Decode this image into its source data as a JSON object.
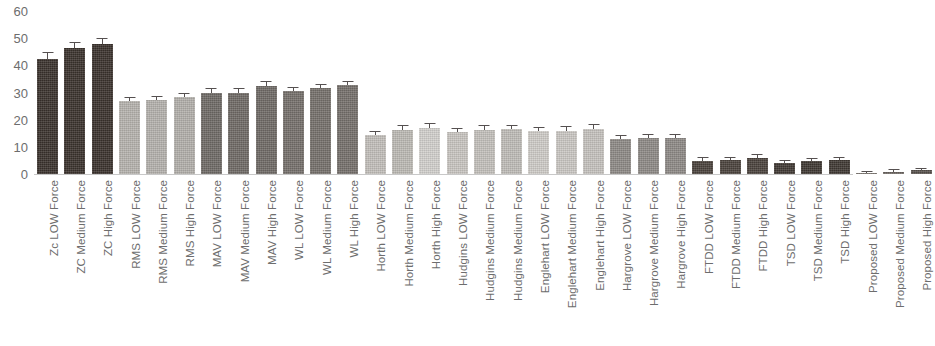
{
  "chart_data": {
    "type": "bar",
    "title": "",
    "subtitle": "",
    "xlabel": "",
    "ylabel": "",
    "ylim": [
      0,
      60
    ],
    "yticks": [
      60,
      50,
      40,
      30,
      20,
      10,
      0
    ],
    "grid": false,
    "legend": "none",
    "errorbars": true,
    "categories": [
      "Zc LOW Force",
      "ZC Medium Force",
      "ZC High Force",
      "RMS LOW Force",
      "RMS Medium Force",
      "RMS High Force",
      "MAV LOW Force",
      "MAV Medium Force",
      "MAV High Force",
      "WL LOW Force",
      "WL Medium Force",
      "WL High Force",
      "Horth LOW Force",
      "Horth Medium Force",
      "Horth High Force",
      "Hudgins LOW Force",
      "Hudgins Medium Force",
      "Hudgins Medium Force",
      "Englehart LOW Force",
      "Englehart Medium Force",
      "Englehart High Force",
      "Hargrove LOW Force",
      "Hargrove Medium Force",
      "Hargrove High Force",
      "FTDD LOW Force",
      "FTDD Medium Force",
      "FTDD High Force",
      "TSD LOW Force",
      "TSD Medium Force",
      "TSD High Force",
      "Proposed LOW Force",
      "Proposed Medium Force",
      "Proposed High Force"
    ],
    "values": [
      42.2,
      46.3,
      48.0,
      26.8,
      27.2,
      28.2,
      29.8,
      30.0,
      32.3,
      30.5,
      31.5,
      32.7,
      14.2,
      16.3,
      17.0,
      15.5,
      16.2,
      16.5,
      15.7,
      15.8,
      16.6,
      13.0,
      13.2,
      13.3,
      4.8,
      5.0,
      6.0,
      4.0,
      4.8,
      5.2,
      0.3,
      0.8,
      1.3
    ],
    "errors": [
      2.6,
      2.4,
      2.2,
      1.6,
      1.6,
      1.6,
      1.8,
      1.8,
      1.8,
      1.7,
      1.7,
      1.7,
      1.6,
      1.7,
      1.7,
      1.6,
      1.7,
      1.7,
      1.7,
      1.7,
      1.7,
      1.5,
      1.5,
      1.5,
      1.3,
      1.3,
      1.3,
      1.2,
      1.2,
      1.2,
      0.9,
      0.9,
      0.9
    ],
    "bar_colors": [
      "#3a322c",
      "#3a322c",
      "#3a322c",
      "#b6b3ae",
      "#b5b2ad",
      "#b3b0ab",
      "#6f6a66",
      "#6f6a66",
      "#6f6a66",
      "#75706b",
      "#75706b",
      "#75706b",
      "#c3c0bb",
      "#bdbab5",
      "#d3d1cd",
      "#c9c6c2",
      "#c4c1bc",
      "#c0bdb8",
      "#cfccc8",
      "#cbc8c4",
      "#c6c3bf",
      "#8e8a86",
      "#8e8a86",
      "#8e8a86",
      "#4a423c",
      "#4a423c",
      "#4a423c",
      "#3f3833",
      "#3f3833",
      "#3f3833",
      "#6b6560",
      "#6b6560",
      "#56504b"
    ]
  }
}
